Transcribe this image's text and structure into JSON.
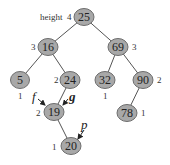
{
  "diagram": {
    "type": "avl-tree",
    "colors": {
      "node_fill": "#a8a8a8",
      "node_stroke": "#6e6e6e",
      "edge": "#555555",
      "text": "#222222"
    },
    "height_prefix": "height",
    "nodes": [
      {
        "id": "n25",
        "key": "25",
        "height": "4",
        "cx": 84,
        "cy": 17,
        "hpos": "left-prefixed"
      },
      {
        "id": "n16",
        "key": "16",
        "height": "3",
        "cx": 48,
        "cy": 47,
        "hpos": "left"
      },
      {
        "id": "n69",
        "key": "69",
        "height": "3",
        "cx": 118,
        "cy": 47,
        "hpos": "right"
      },
      {
        "id": "n5",
        "key": "5",
        "height": "1",
        "cx": 20,
        "cy": 80,
        "hpos": "below"
      },
      {
        "id": "n24",
        "key": "24",
        "height": "2",
        "cx": 70,
        "cy": 80,
        "hpos": "left"
      },
      {
        "id": "n32",
        "key": "32",
        "height": "1",
        "cx": 105,
        "cy": 80,
        "hpos": "below"
      },
      {
        "id": "n90",
        "key": "90",
        "height": "2",
        "cx": 143,
        "cy": 80,
        "hpos": "right"
      },
      {
        "id": "n19",
        "key": "19",
        "height": "2",
        "cx": 54,
        "cy": 112,
        "hpos": "left"
      },
      {
        "id": "n78",
        "key": "78",
        "height": "1",
        "cx": 127,
        "cy": 113,
        "hpos": "right"
      },
      {
        "id": "n20",
        "key": "20",
        "height": "1",
        "cx": 71,
        "cy": 146,
        "hpos": "left"
      }
    ],
    "edges": [
      [
        "n25",
        "n16"
      ],
      [
        "n25",
        "n69"
      ],
      [
        "n16",
        "n5"
      ],
      [
        "n16",
        "n24"
      ],
      [
        "n69",
        "n32"
      ],
      [
        "n69",
        "n90"
      ],
      [
        "n24",
        "n19"
      ],
      [
        "n90",
        "n78"
      ],
      [
        "n19",
        "n20"
      ]
    ],
    "pointers": [
      {
        "label": "f",
        "target": "n19",
        "from": "upper-left",
        "bold": false
      },
      {
        "label": "g",
        "target": "n19",
        "from": "upper-right",
        "bold": true
      },
      {
        "label": "p",
        "target": "n20",
        "from": "upper-right",
        "bold": false
      }
    ]
  }
}
